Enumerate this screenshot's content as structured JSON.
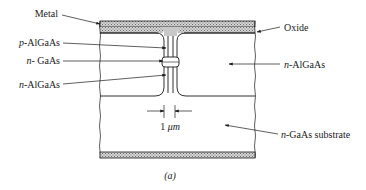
{
  "figure": {
    "caption": "(a)",
    "colors": {
      "line": "#1a1a1a",
      "hatch_fill": "#bdbdbd",
      "mesa_fill": "#c8c8c8",
      "background": "#ffffff"
    },
    "labels": {
      "metal": "Metal",
      "oxide": "Oxide",
      "p_algaas_prefix": "p",
      "p_algaas_suffix": "-AlGaAs",
      "n_gaas_prefix": "n",
      "n_gaas_suffix": "- GaAs",
      "n_algaas_left_prefix": "n",
      "n_algaas_left_suffix": "-AlGaAs",
      "n_algaas_right_prefix": "n",
      "n_algaas_right_suffix": "-AlGaAs",
      "substrate_prefix": "n",
      "substrate_suffix": "-GaAs substrate",
      "dimension_value": "1",
      "dimension_unit": "μm"
    }
  }
}
